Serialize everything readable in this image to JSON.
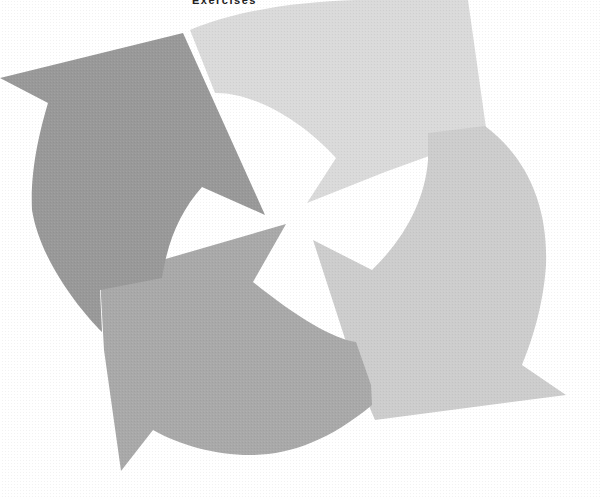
{
  "heading": {
    "text": "Exercises"
  },
  "diagram": {
    "type": "cycle-arrows",
    "arrow_count": 4,
    "arrows": [
      {
        "name": "top-arrow",
        "position": "top-right",
        "direction": "clockwise",
        "color": "#dadada"
      },
      {
        "name": "right-arrow",
        "position": "right",
        "direction": "clockwise",
        "color": "#cdcdcd"
      },
      {
        "name": "bottom-arrow",
        "position": "bottom-left",
        "direction": "clockwise",
        "color": "#a9a9a9"
      },
      {
        "name": "left-arrow",
        "position": "left",
        "direction": "clockwise",
        "color": "#999999"
      }
    ],
    "background": "#ffffff"
  }
}
